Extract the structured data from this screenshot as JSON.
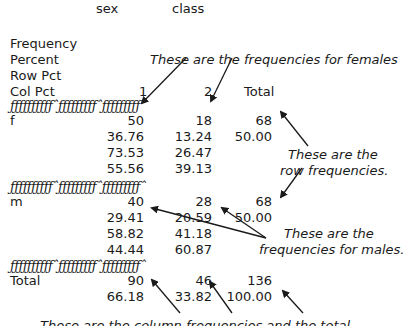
{
  "header": {
    "row_var": "sex",
    "col_var": "class"
  },
  "stat_labels": [
    "Frequency",
    "Percent",
    "Row Pct",
    "Col Pct"
  ],
  "columns": [
    "1",
    "2",
    "Total"
  ],
  "separator": "ƒƒƒƒƒƒƒƒƒƒˆƒƒƒƒƒƒƒƒƒˆƒƒƒƒƒƒƒƒƒˆ",
  "rows": [
    {
      "label": "f",
      "cells": [
        [
          "50",
          "36.76",
          "73.53",
          "55.56"
        ],
        [
          "18",
          "13.24",
          "26.47",
          "39.13"
        ],
        [
          "68",
          "50.00"
        ]
      ]
    },
    {
      "label": "m",
      "cells": [
        [
          "40",
          "29.41",
          "58.82",
          "44.44"
        ],
        [
          "28",
          "20.59",
          "41.18",
          "60.87"
        ],
        [
          "68",
          "50.00"
        ]
      ]
    }
  ],
  "total": {
    "label": "Total",
    "cells": [
      [
        "90",
        "66.18"
      ],
      [
        "46",
        "33.82"
      ],
      [
        "136",
        "100.00"
      ]
    ]
  },
  "annotations": {
    "females": "These are the frequencies for females",
    "row_line1": "These are the",
    "row_line2": "row frequencies.",
    "males_line1": "These are the",
    "males_line2": "frequencies for males.",
    "bottom_clipped": "These are the column frequencies and the total"
  },
  "colors": {
    "text": "#1a1a1a",
    "arrow": "#1a1a1a",
    "background": "#ffffff"
  }
}
